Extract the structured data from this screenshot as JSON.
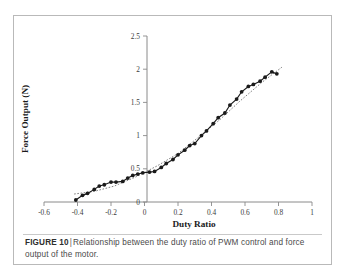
{
  "figure": {
    "caption_label": "FIGURE 10",
    "caption_separator": "|",
    "caption_text": "Relationship between the duty ratio of PWM control and force output of the motor."
  },
  "colors": {
    "frame_border": "#b9b9b9",
    "axis": "#8a8a8a",
    "series_line": "#1a1a1a",
    "marker_fill": "#1a1a1a",
    "trend_line": "#707070",
    "tick_text": "#3c3c3c",
    "caption_text": "#4a4a4a"
  },
  "chart_data": {
    "type": "line",
    "title": "",
    "xlabel": "Duty Ratio",
    "ylabel": "Force Output (N)",
    "xlim": [
      -0.6,
      1.0
    ],
    "ylim": [
      0,
      2.5
    ],
    "xticks": [
      -0.6,
      -0.4,
      -0.2,
      0,
      0.2,
      0.4,
      0.6,
      0.8,
      1
    ],
    "xticklabels": [
      "-0.6",
      "-0.4",
      "-0.2",
      "0",
      "0.2",
      "0.4",
      "0.6",
      "0.8",
      "1"
    ],
    "yticks": [
      0,
      0.5,
      1,
      1.5,
      2,
      2.5
    ],
    "yticklabels": [
      "0",
      "0.5",
      "1",
      "1.5",
      "2",
      "2.5"
    ],
    "grid": false,
    "legend": null,
    "markers": "filled-circle",
    "series": [
      {
        "name": "Measured force output",
        "style": "solid-line-with-markers",
        "x": [
          -0.41,
          -0.37,
          -0.34,
          -0.3,
          -0.27,
          -0.24,
          -0.2,
          -0.17,
          -0.13,
          -0.1,
          -0.07,
          -0.04,
          -0.01,
          0.03,
          0.06,
          0.1,
          0.13,
          0.17,
          0.2,
          0.24,
          0.27,
          0.3,
          0.34,
          0.37,
          0.41,
          0.44,
          0.48,
          0.51,
          0.55,
          0.58,
          0.62,
          0.65,
          0.69,
          0.72,
          0.76,
          0.79
        ],
        "y": [
          0.03,
          0.1,
          0.13,
          0.19,
          0.24,
          0.26,
          0.3,
          0.3,
          0.31,
          0.36,
          0.4,
          0.42,
          0.44,
          0.45,
          0.46,
          0.52,
          0.58,
          0.64,
          0.71,
          0.78,
          0.85,
          0.88,
          1.0,
          1.07,
          1.18,
          1.27,
          1.34,
          1.46,
          1.55,
          1.66,
          1.74,
          1.77,
          1.82,
          1.88,
          1.96,
          1.93
        ]
      },
      {
        "name": "Fitted trend",
        "style": "dotted-line",
        "x": [
          -0.42,
          -0.3,
          -0.18,
          -0.05,
          0.08,
          0.2,
          0.32,
          0.45,
          0.57,
          0.7,
          0.82
        ],
        "y": [
          0.12,
          0.16,
          0.24,
          0.38,
          0.55,
          0.73,
          0.97,
          1.24,
          1.52,
          1.8,
          2.03
        ]
      }
    ]
  }
}
